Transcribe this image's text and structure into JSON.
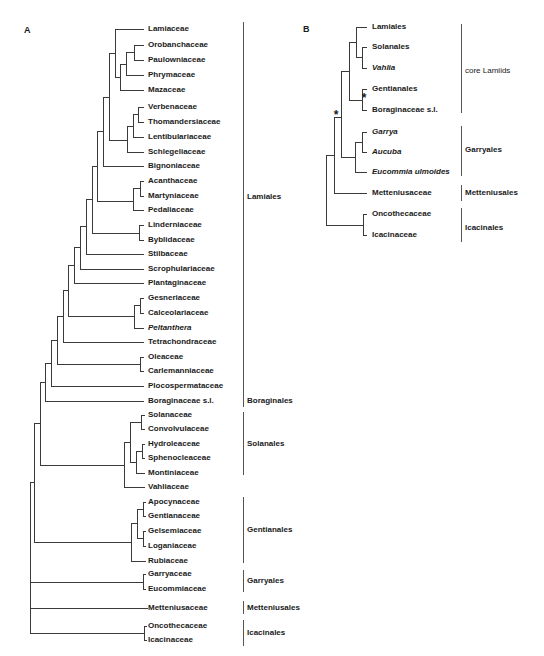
{
  "panels": {
    "A": {
      "letter": "A",
      "leaves": [
        {
          "label": "Lamiaceae",
          "y": 29
        },
        {
          "label": "Orobanchaceae",
          "y": 45
        },
        {
          "label": "Paulowniaceae",
          "y": 60
        },
        {
          "label": "Phrymaceae",
          "y": 75
        },
        {
          "label": "Mazaceae",
          "y": 90
        },
        {
          "label": "Verbenaceae",
          "y": 107
        },
        {
          "label": "Thomandersiaceae",
          "y": 122
        },
        {
          "label": "Lentibulariaceae",
          "y": 137
        },
        {
          "label": "Schlegeliaceae",
          "y": 152
        },
        {
          "label": "Bignoniaceae",
          "y": 166
        },
        {
          "label": "Acanthaceae",
          "y": 181
        },
        {
          "label": "Martyniaceae",
          "y": 196
        },
        {
          "label": "Pedaliaceae",
          "y": 210
        },
        {
          "label": "Linderniaceae",
          "y": 225
        },
        {
          "label": "Byblidaceae",
          "y": 240
        },
        {
          "label": "Stilbaceae",
          "y": 254
        },
        {
          "label": "Scrophulariaceae",
          "y": 269
        },
        {
          "label": "Plantaginaceae",
          "y": 283
        },
        {
          "label": "Gesneriaceae",
          "y": 298
        },
        {
          "label": "Calceolariaceae",
          "y": 313
        },
        {
          "label": "Peltanthera",
          "y": 328,
          "italic": true
        },
        {
          "label": "Tetrachondraceae",
          "y": 342
        },
        {
          "label": "Oleaceae",
          "y": 357
        },
        {
          "label": "Carlemanniaceae",
          "y": 371
        },
        {
          "label": "Plocospermataceae",
          "y": 386
        },
        {
          "label": "Boraginaceae s.l.",
          "y": 401
        },
        {
          "label": "Solanaceae",
          "y": 415
        },
        {
          "label": "Convolvulaceae",
          "y": 429
        },
        {
          "label": "Hydroleaceae",
          "y": 444
        },
        {
          "label": "Sphenocleaceae",
          "y": 458
        },
        {
          "label": "Montiniaceae",
          "y": 473
        },
        {
          "label": "Vahliaceae",
          "y": 487
        },
        {
          "label": "Apocynaceae",
          "y": 502
        },
        {
          "label": "Gentianaceae",
          "y": 516
        },
        {
          "label": "Gelsemiaceae",
          "y": 531
        },
        {
          "label": "Loganiaceae",
          "y": 546
        },
        {
          "label": "Rubiaceae",
          "y": 561
        },
        {
          "label": "Garryaceae",
          "y": 574
        },
        {
          "label": "Eucommiaceae",
          "y": 589
        },
        {
          "label": "Metteniusaceae",
          "y": 608
        },
        {
          "label": "Oncothecaceae",
          "y": 626
        },
        {
          "label": "Icacinaceae",
          "y": 640
        }
      ],
      "clades": [
        {
          "label": "Lamiales",
          "y1": 22,
          "y2": 395,
          "labelY": 197
        },
        {
          "label": "Boraginales",
          "y1": 395,
          "y2": 407,
          "labelY": 401
        },
        {
          "label": "Solanales",
          "y1": 412,
          "y2": 475,
          "labelY": 444
        },
        {
          "label": "Gentianales",
          "y1": 497,
          "y2": 563,
          "labelY": 530
        },
        {
          "label": "Garryales",
          "y1": 570,
          "y2": 592,
          "labelY": 581
        },
        {
          "label": "Metteniusales",
          "y1": 601,
          "y2": 614,
          "labelY": 608
        },
        {
          "label": "Icacinales",
          "y1": 620,
          "y2": 646,
          "labelY": 633
        }
      ]
    },
    "B": {
      "letter": "B",
      "leaves": [
        {
          "label": "Lamiales",
          "y": 27
        },
        {
          "label": "Solanales",
          "y": 47
        },
        {
          "label": "Vahlia",
          "y": 68,
          "italic": true
        },
        {
          "label": "Gentianales",
          "y": 89
        },
        {
          "label": "Boraginaceae  s.l.",
          "y": 110
        },
        {
          "label": "Garrya",
          "y": 132,
          "italic": true
        },
        {
          "label": "Aucuba",
          "y": 152,
          "italic": true
        },
        {
          "label": "Eucommia ulmoides",
          "y": 172,
          "italic": true
        },
        {
          "label": "Metteniusaceae",
          "y": 193
        },
        {
          "label": "Oncothecaceae",
          "y": 214
        },
        {
          "label": "Icacinaceae",
          "y": 235
        }
      ],
      "clades": [
        {
          "label": "core Lamiids",
          "y1": 24,
          "y2": 113,
          "labelY": 71,
          "normal": true
        },
        {
          "label": "Garryales",
          "y1": 126,
          "y2": 176,
          "labelY": 150
        },
        {
          "label": "Metteniusales",
          "y1": 185,
          "y2": 201,
          "labelY": 193
        },
        {
          "label": "Icacinales",
          "y1": 208,
          "y2": 242,
          "labelY": 228
        }
      ],
      "support_marks": [
        {
          "symbol": "*",
          "x": 364,
          "y": 100
        },
        {
          "symbol": "*",
          "x": 336,
          "y": 117
        }
      ]
    }
  }
}
